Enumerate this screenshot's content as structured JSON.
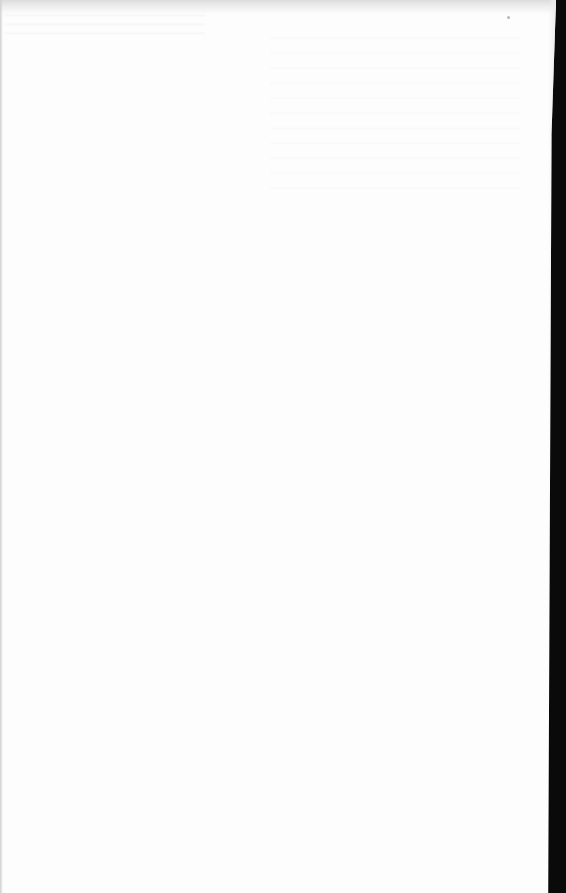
{
  "document": {
    "type": "scanned-page",
    "content": "",
    "page_color": "#fdfdfd",
    "scanner_background_color": "#0a0a0a"
  }
}
